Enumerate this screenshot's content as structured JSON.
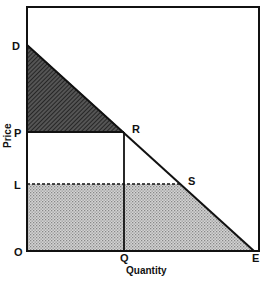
{
  "diagram": {
    "type": "supply-demand-surplus",
    "axes": {
      "x_label": "Quantity",
      "y_label": "Price"
    },
    "points": {
      "D": "D",
      "P": "P",
      "L": "L",
      "O": "O",
      "R": "R",
      "S": "S",
      "Q": "Q",
      "E": "E"
    },
    "regions": [
      {
        "name": "triangle-DPR",
        "fill": "dark-hatched"
      },
      {
        "name": "trapezoid-OLSE",
        "fill": "light-dotted"
      }
    ],
    "colors": {
      "line": "#111111",
      "dark_fill": "#3a3a3a",
      "light_fill": "#bdbdbd"
    }
  }
}
